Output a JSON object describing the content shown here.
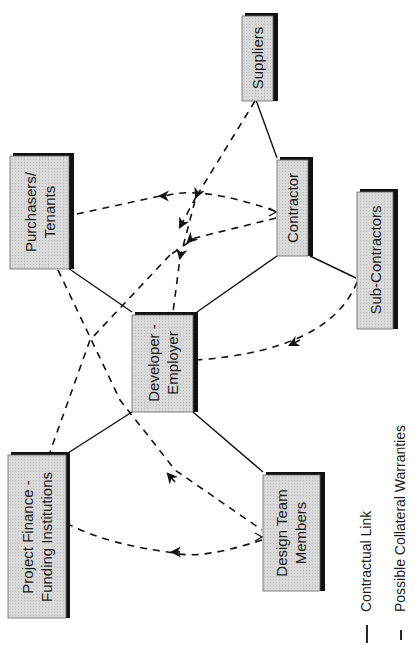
{
  "diagram": {
    "type": "contract-relationship-diagram",
    "orientation": "rotated-90-ccw",
    "colors": {
      "box_fill": "#d6d6d6",
      "box_border": "#555555",
      "shadow": "#111111",
      "line": "#111111"
    },
    "nodes": [
      {
        "id": "suppliers",
        "lines": [
          "Suppliers"
        ]
      },
      {
        "id": "purchasers",
        "lines": [
          "Purchasers/",
          "Tenants"
        ]
      },
      {
        "id": "contractor",
        "lines": [
          "Contractor"
        ]
      },
      {
        "id": "subcontractors",
        "lines": [
          "Sub-Contractors"
        ]
      },
      {
        "id": "developer",
        "lines": [
          "Developer -",
          "Employer"
        ]
      },
      {
        "id": "finance",
        "lines": [
          "Project Finance -",
          "Funding Institutions"
        ]
      },
      {
        "id": "design",
        "lines": [
          "Design Team",
          "Members"
        ]
      }
    ],
    "contractual_links": [
      [
        "suppliers",
        "contractor"
      ],
      [
        "contractor",
        "subcontractors"
      ],
      [
        "contractor",
        "developer"
      ],
      [
        "purchasers",
        "developer"
      ],
      [
        "developer",
        "finance"
      ],
      [
        "developer",
        "design"
      ]
    ],
    "collateral_warranties": [
      {
        "from": "suppliers",
        "to": "developer"
      },
      {
        "from": "contractor",
        "to": "purchasers"
      },
      {
        "from": "contractor",
        "to": "finance"
      },
      {
        "from": "subcontractors",
        "to": "developer"
      },
      {
        "from": "design",
        "to": "purchasers"
      },
      {
        "from": "design",
        "to": "finance"
      }
    ],
    "legend": {
      "contractual": "Contractual Link",
      "collateral": "Possible Collateral Warranties"
    }
  }
}
